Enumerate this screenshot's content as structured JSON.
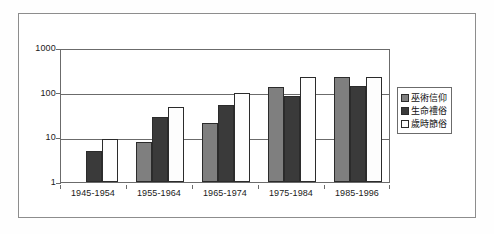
{
  "chart_data": {
    "type": "bar",
    "title": "",
    "xlabel": "",
    "ylabel": "",
    "yscale": "log",
    "ylim": [
      1,
      1000
    ],
    "grid": true,
    "legend_position": "right",
    "categories": [
      "1945-1954",
      "1955-1964",
      "1965-1974",
      "1975-1984",
      "1985-1996"
    ],
    "y_ticks": [
      "1",
      "10",
      "100",
      "1000"
    ],
    "y_tick_values": [
      1,
      10,
      100,
      1000
    ],
    "series": [
      {
        "name": "巫術信仰",
        "color": "#7f7f7f",
        "values": [
          0,
          8,
          21,
          135,
          220
        ]
      },
      {
        "name": "生命禮俗",
        "color": "#3a3a3a",
        "values": [
          5,
          28,
          52,
          85,
          140
        ]
      },
      {
        "name": "歲時節俗",
        "color": "#fdfdfd",
        "values": [
          9,
          47,
          99,
          220,
          220
        ]
      }
    ]
  },
  "legend": {
    "items": [
      {
        "label": "巫術信仰"
      },
      {
        "label": "生命禮俗"
      },
      {
        "label": "歲時節俗"
      }
    ]
  },
  "axes": {
    "y_labels": [
      "1000",
      "100",
      "10",
      "1"
    ],
    "x_labels": [
      "1945-1954",
      "1955-1964",
      "1965-1974",
      "1975-1984",
      "1985-1996"
    ]
  }
}
